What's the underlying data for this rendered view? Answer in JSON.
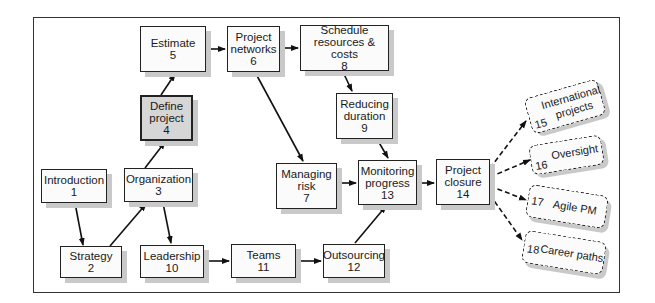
{
  "diagram": {
    "type": "flowchart",
    "nodes": [
      {
        "id": "1",
        "label": "Introduction",
        "number": "1"
      },
      {
        "id": "2",
        "label": "Strategy",
        "number": "2"
      },
      {
        "id": "3",
        "label": "Organization",
        "number": "3"
      },
      {
        "id": "4",
        "label_line1": "Define",
        "label_line2": "project",
        "number": "4",
        "highlighted": true
      },
      {
        "id": "5",
        "label": "Estimate",
        "number": "5"
      },
      {
        "id": "6",
        "label_line1": "Project",
        "label_line2": "networks",
        "number": "6"
      },
      {
        "id": "7",
        "label_line1": "Managing",
        "label_line2": "risk",
        "number": "7"
      },
      {
        "id": "8",
        "label_line1": "Schedule",
        "label_line2": "resources & costs",
        "number": "8"
      },
      {
        "id": "9",
        "label_line1": "Reducing",
        "label_line2": "duration",
        "number": "9"
      },
      {
        "id": "10",
        "label": "Leadership",
        "number": "10"
      },
      {
        "id": "11",
        "label": "Teams",
        "number": "11"
      },
      {
        "id": "12",
        "label": "Outsourcing",
        "number": "12"
      },
      {
        "id": "13",
        "label_line1": "Monitoring",
        "label_line2": "progress",
        "number": "13"
      },
      {
        "id": "14",
        "label_line1": "Project",
        "label_line2": "closure",
        "number": "14"
      },
      {
        "id": "15",
        "label_line1": "International",
        "label_line2": "projects",
        "number": "15",
        "dashed": true
      },
      {
        "id": "16",
        "label": "Oversight",
        "number": "16",
        "dashed": true
      },
      {
        "id": "17",
        "label": "Agile PM",
        "number": "17",
        "dashed": true
      },
      {
        "id": "18",
        "label": "Career paths",
        "number": "18",
        "dashed": true
      }
    ],
    "edges": [
      {
        "from": "1",
        "to": "2"
      },
      {
        "from": "2",
        "to": "3"
      },
      {
        "from": "3",
        "to": "4"
      },
      {
        "from": "3",
        "to": "10"
      },
      {
        "from": "4",
        "to": "5"
      },
      {
        "from": "5",
        "to": "6"
      },
      {
        "from": "6",
        "to": "8"
      },
      {
        "from": "6",
        "to": "7"
      },
      {
        "from": "8",
        "to": "9"
      },
      {
        "from": "9",
        "to": "13"
      },
      {
        "from": "7",
        "to": "13"
      },
      {
        "from": "10",
        "to": "11"
      },
      {
        "from": "11",
        "to": "12"
      },
      {
        "from": "12",
        "to": "13"
      },
      {
        "from": "13",
        "to": "14"
      },
      {
        "from": "14",
        "to": "15",
        "style": "dashed"
      },
      {
        "from": "14",
        "to": "16",
        "style": "dashed"
      },
      {
        "from": "14",
        "to": "17",
        "style": "dashed"
      },
      {
        "from": "14",
        "to": "18",
        "style": "dashed"
      }
    ]
  },
  "colors": {
    "box_fill": "#fbfbfb",
    "highlight_fill": "#d6d6d6",
    "shadow": "#c9c9c9",
    "line": "#222222"
  }
}
